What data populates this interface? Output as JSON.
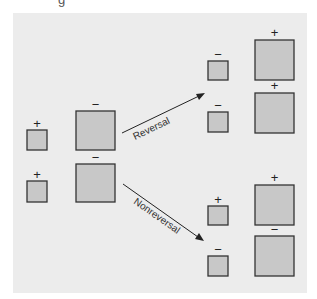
{
  "header_fragment": "g",
  "diagram": {
    "colors": {
      "panel_background": "#ececec",
      "box_fill": "#c8c8c8",
      "box_stroke": "#333333",
      "text": "#222222"
    },
    "initial_state": {
      "small_boxes": [
        {
          "sign": "+"
        },
        {
          "sign": "+"
        }
      ],
      "large_boxes": [
        {
          "sign": "−"
        },
        {
          "sign": "−"
        }
      ]
    },
    "arrows": [
      {
        "label": "Reversal",
        "direction": "up-right"
      },
      {
        "label": "Nonreversal",
        "direction": "down-right"
      }
    ],
    "reversal_outcome": {
      "small_boxes": [
        {
          "sign": "−"
        },
        {
          "sign": "−"
        }
      ],
      "large_boxes": [
        {
          "sign": "+"
        },
        {
          "sign": "+"
        }
      ]
    },
    "nonreversal_outcome": {
      "small_boxes": [
        {
          "sign": "+"
        },
        {
          "sign": "−"
        }
      ],
      "large_boxes": [
        {
          "sign": "+"
        },
        {
          "sign": "−"
        }
      ]
    }
  }
}
